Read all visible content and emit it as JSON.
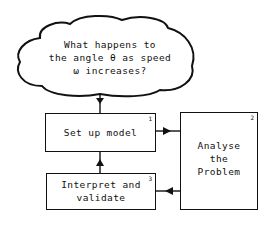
{
  "question": {
    "line1": "What happens to",
    "line2": "the angle θ as speed",
    "line3": "ω increases?"
  },
  "steps": [
    {
      "number": "1",
      "label": "Set up model"
    },
    {
      "number": "2",
      "label_lines": [
        "Analyse",
        "the",
        "Problem"
      ]
    },
    {
      "number": "3",
      "label_lines": [
        "Interpret and",
        "validate"
      ]
    }
  ],
  "colors": {
    "stroke": "#111111",
    "background": "#ffffff"
  }
}
